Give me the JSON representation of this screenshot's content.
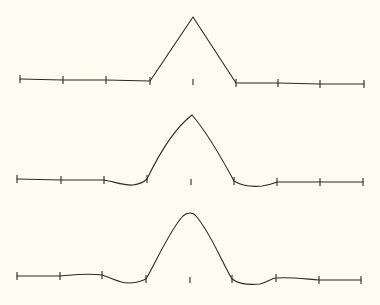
{
  "background": "#fcfcf0",
  "stroke_color": "#2a2a2a",
  "diagram": {
    "tick_half_height": 4,
    "center_tick_half_height": 3,
    "panels": [
      {
        "name": "hat-function",
        "label": "linear",
        "nodes": [
          [
            20,
            79
          ],
          [
            63,
            80
          ],
          [
            106,
            80
          ],
          [
            150,
            81
          ],
          [
            193,
            82
          ],
          [
            236,
            83
          ],
          [
            278,
            83
          ],
          [
            320,
            84
          ],
          [
            364,
            84
          ]
        ],
        "center_tick": [
          193,
          82
        ],
        "path": "M20,79 L63,80 L106,80 L150,81 L193,17 L236,83 L278,83 L320,84 L364,84"
      },
      {
        "name": "quadratic-spline",
        "label": "quadratic",
        "nodes": [
          [
            17,
            179
          ],
          [
            61,
            180
          ],
          [
            104,
            180
          ],
          [
            147,
            179
          ],
          [
            191,
            182
          ],
          [
            234,
            181
          ],
          [
            277,
            182
          ],
          [
            320,
            182
          ],
          [
            363,
            182
          ]
        ],
        "center_tick": [
          191,
          182
        ],
        "path": "M17,179 L61,180 L104,180 C115,182 126,186 133,185 C140,184 144,182 147,179 C160,152 175,128 192,115 C205,130 220,155 234,181 C242,186 252,187 262,186 C270,185 274,183 277,182 L320,182 L363,182"
      },
      {
        "name": "cubic-spline",
        "label": "cubic",
        "nodes": [
          [
            17,
            276
          ],
          [
            60,
            276
          ],
          [
            102,
            275
          ],
          [
            146,
            279
          ],
          [
            190,
            280
          ],
          [
            232,
            279
          ],
          [
            276,
            278
          ],
          [
            319,
            280
          ],
          [
            361,
            280
          ]
        ],
        "center_tick": [
          190,
          280
        ],
        "path": "M17,276 L60,276 C72,275 88,273 102,275 C112,278 120,283 128,283 C136,283 142,281 146,279 C158,258 170,230 183,216 C187,212 193,212 196,216 C210,232 222,262 232,279 C240,285 250,285 260,284 C268,282 272,278 276,278 C290,277 305,279 319,280 L361,280"
      }
    ]
  }
}
